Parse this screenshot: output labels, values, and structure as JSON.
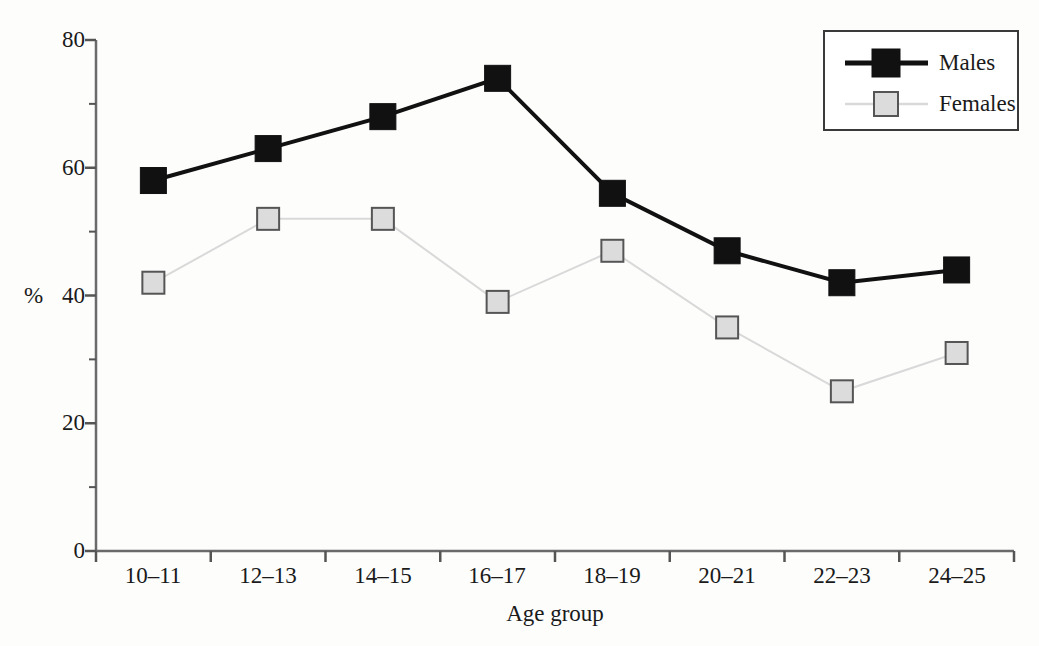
{
  "chart_data": {
    "type": "line",
    "title": "",
    "subtitle": "",
    "xlabel": "Age group",
    "ylabel": "%",
    "categories": [
      "10–11",
      "12–13",
      "14–15",
      "16–17",
      "18–19",
      "20–21",
      "22–23",
      "24–25"
    ],
    "series": [
      {
        "name": "Males",
        "values": [
          58,
          63,
          68,
          74,
          56,
          47,
          42,
          44
        ],
        "color": "#111111",
        "marker": "filled-square",
        "line_width": 4
      },
      {
        "name": "Females",
        "values": [
          42,
          52,
          52,
          39,
          47,
          35,
          25,
          31
        ],
        "color": "#d9d9d9",
        "marker": "open-square",
        "marker_fill": "#dcdcdc",
        "marker_edge": "#555555",
        "line_width": 2
      }
    ],
    "ylim": [
      0,
      80
    ],
    "yticks": [
      0,
      20,
      40,
      60,
      80
    ],
    "ytick_labels": [
      "0",
      "20",
      "40",
      "60",
      "80"
    ],
    "y_minor_tick_interval": 10,
    "xtick_labels": [
      "10–11",
      "12–13",
      "14–15",
      "16–17",
      "18–19",
      "20–21",
      "22–23",
      "24–25"
    ],
    "grid": false,
    "legend": {
      "position": "top-right",
      "border_color": "#333333",
      "entries": [
        {
          "label": "Males",
          "color": "#111111",
          "marker": "filled-square"
        },
        {
          "label": "Females",
          "color": "#d9d9d9",
          "marker": "open-square"
        }
      ]
    },
    "axis_color": "#555555",
    "background": "#fdfdfc"
  }
}
